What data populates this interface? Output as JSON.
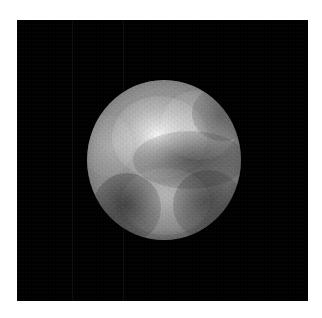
{
  "image": {
    "subject": "planetary-disk",
    "description": "Grayscale telescope image of a planetary disk on a black sky background",
    "canvas_width": 322,
    "canvas_height": 318,
    "page_background": "#ffffff",
    "frame": {
      "background": "#000000",
      "left": 17,
      "top": 20,
      "width": 291,
      "height": 281
    },
    "disk": {
      "center_x": 164,
      "center_y": 160,
      "radius_x": 77,
      "radius_y": 80,
      "mean_gray": "#8c8c8c",
      "brightest_gray": "#f0f0f0",
      "darkest_gray": "#1a1a1a"
    },
    "features": [
      {
        "name": "bright-core",
        "label": "bright high-albedo region",
        "position": "upper-left of centre",
        "brightness": "#f0f0f0"
      },
      {
        "name": "bright-north-east",
        "label": "bright patch",
        "position": "upper right",
        "brightness": "#c8c8c8"
      },
      {
        "name": "bright-south",
        "label": "bright band",
        "position": "lower centre",
        "brightness": "#bcbcbc"
      },
      {
        "name": "bright-west-limb",
        "label": "bright limb sliver",
        "position": "left limb",
        "brightness": "#b4b4b4"
      },
      {
        "name": "dark-belt",
        "label": "dark equatorial belt",
        "position": "centre",
        "brightness": "#5a5a5a"
      },
      {
        "name": "dark-south-west",
        "label": "dark terrain",
        "position": "lower left",
        "brightness": "#3c3c3c"
      },
      {
        "name": "dark-south-east",
        "label": "dark terrain",
        "position": "lower right",
        "brightness": "#4e4e4e"
      },
      {
        "name": "dark-north-east",
        "label": "dark notch",
        "position": "upper right limb",
        "brightness": "#5c5c5c"
      }
    ],
    "artifacts": {
      "seam_lines": [
        {
          "name": "seam-line-1",
          "x": 72,
          "shade": "#111114"
        },
        {
          "name": "seam-line-2",
          "x": 123,
          "shade": "#111114"
        }
      ],
      "texture": "blocky deconvolution / pixel reconstruction grain"
    }
  }
}
